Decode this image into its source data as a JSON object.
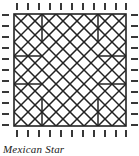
{
  "figure": {
    "caption": "Mexican Star",
    "kind": "quilt-block-pattern-diagram",
    "line_color": "#222222",
    "background_color": "#ffffff",
    "frame": {
      "x": 14,
      "y": 14,
      "width": 112,
      "height": 112,
      "stroke_width": 1.6
    },
    "tick_marks": {
      "count_per_edge": 11,
      "length": 7,
      "stroke_width": 1.8,
      "gap_from_frame": 3,
      "edges": [
        "top",
        "right",
        "bottom",
        "left"
      ]
    },
    "pattern_geometry": {
      "grid_divisions": 8,
      "cell": 14,
      "description": "Mexican Star: diagonal lattice of parallel lines in both directions plus corner rectangles and notched bars"
    }
  }
}
